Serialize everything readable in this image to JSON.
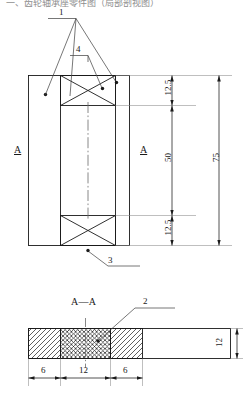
{
  "drawing": {
    "clipped_header_text": "一、齿轮轴承座零件图（局部剖视图）",
    "title_section": "A—A",
    "section_marks": [
      {
        "id": "section-mark-left",
        "label": "A"
      },
      {
        "id": "section-mark-middle",
        "label": "A"
      }
    ],
    "callouts": [
      {
        "id": "callout-1",
        "label": "1"
      },
      {
        "id": "callout-4",
        "label": "4"
      },
      {
        "id": "callout-3",
        "label": "3"
      },
      {
        "id": "callout-2",
        "label": "2"
      }
    ],
    "plan_view": {
      "name": "plan-view",
      "dimensions_vertical": [
        {
          "id": "dim-top-12-5",
          "value": "12.5",
          "orientation": "vertical"
        },
        {
          "id": "dim-middle-50",
          "value": "50",
          "orientation": "vertical"
        },
        {
          "id": "dim-bottom-12-5",
          "value": "12.5",
          "orientation": "vertical"
        },
        {
          "id": "dim-overall-75",
          "value": "75",
          "orientation": "vertical"
        }
      ]
    },
    "section_view": {
      "name": "section-view-a-a",
      "dimensions_horizontal": [
        {
          "id": "dim-left-6",
          "value": "6"
        },
        {
          "id": "dim-center-12",
          "value": "12"
        },
        {
          "id": "dim-right-6",
          "value": "6"
        }
      ],
      "dimensions_vertical": [
        {
          "id": "dim-thickness-12",
          "value": "12",
          "orientation": "vertical"
        }
      ],
      "hatch_blocks": [
        {
          "id": "hatch-block-left",
          "pattern": "diagonal"
        },
        {
          "id": "hatch-block-center",
          "pattern": "cross"
        },
        {
          "id": "hatch-block-right",
          "pattern": "diagonal"
        }
      ]
    },
    "colors": {
      "line": "#1a1a1a",
      "thin_line": "#4a4a4a",
      "background": "#ffffff",
      "header_text": "#8d8d8d"
    }
  }
}
